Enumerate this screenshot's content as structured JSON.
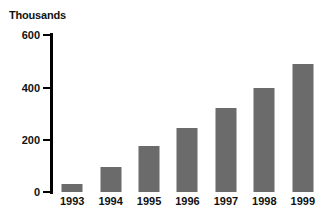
{
  "chart_data": {
    "type": "bar",
    "title": "Thousands",
    "xlabel": "",
    "ylabel": "Thousands",
    "categories": [
      "1993",
      "1994",
      "1995",
      "1996",
      "1997",
      "1998",
      "1999"
    ],
    "values": [
      30,
      97,
      175,
      245,
      320,
      397,
      490
    ],
    "ylim": [
      0,
      600
    ],
    "yticks": [
      0,
      200,
      400,
      600
    ],
    "ytick_labels": [
      "0",
      "200",
      "400",
      "600"
    ],
    "grid": false,
    "legend": null,
    "series": [
      {
        "name": "Thousands",
        "values": [
          30,
          97,
          175,
          245,
          320,
          397,
          490
        ]
      }
    ],
    "colors": {
      "bar_fill": "#6b6b6b",
      "axis": "#000000",
      "text": "#111111",
      "background": "#ffffff"
    }
  }
}
